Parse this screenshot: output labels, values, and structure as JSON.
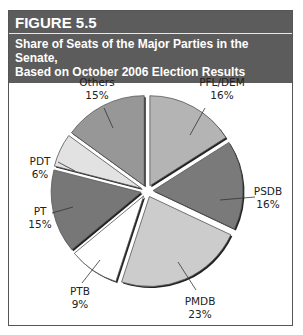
{
  "figure": {
    "number": "FIGURE 5.5",
    "title_line1": "Share of Seats of the Major Parties in the Senate,",
    "title_line2": "Based on October 2006 Election Results"
  },
  "chart_data": {
    "type": "pie",
    "title": "Share of Seats of the Major Parties in the Senate, Based on October 2006 Election Results",
    "categories": [
      "PFL/DEM",
      "PSDB",
      "PMDB",
      "PTB",
      "PT",
      "PDT",
      "Others"
    ],
    "values": [
      16,
      16,
      23,
      9,
      15,
      6,
      15
    ],
    "unit": "%",
    "labels": [
      "PFL/DEM",
      "PSDB",
      "PMDB",
      "PTB",
      "PT",
      "PDT",
      "Others"
    ],
    "value_labels": [
      "16%",
      "16%",
      "23%",
      "9%",
      "15%",
      "6%",
      "15%"
    ],
    "colors": [
      "#b4b4b4",
      "#7a7a7a",
      "#cccccc",
      "#ffffff",
      "#777777",
      "#e2e2e2",
      "#979797"
    ],
    "start_angle_deg": 0,
    "direction": "clockwise",
    "exploded": true,
    "legend": "none (direct labels with leader lines)"
  }
}
